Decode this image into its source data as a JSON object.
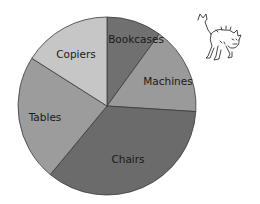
{
  "chart_data": {
    "type": "pie",
    "title": "",
    "start_angle_deg": -90,
    "direction": "clockwise",
    "categories": [
      "Bookcases",
      "Machines",
      "Chairs",
      "Tables",
      "Copiers"
    ],
    "values": [
      10,
      16,
      35,
      23,
      16
    ],
    "colors": [
      "#707070",
      "#9a9a9a",
      "#6b6b6b",
      "#9c9c9c",
      "#c6c6c6"
    ],
    "label_positions": [
      {
        "x": 136,
        "y": 39
      },
      {
        "x": 168,
        "y": 81
      },
      {
        "x": 128,
        "y": 159
      },
      {
        "x": 45,
        "y": 117
      },
      {
        "x": 76,
        "y": 54
      }
    ],
    "legend": "none",
    "labels_inside": true
  },
  "decoration": {
    "illustration": "scared-cat-icon"
  }
}
